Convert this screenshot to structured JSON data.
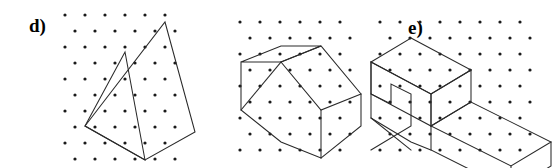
{
  "figure": {
    "background_color": "#ffffff",
    "ink_color": "#2a2a2a",
    "dot_color": "#1a1a1a",
    "width": 560,
    "height": 168
  },
  "panels": [
    {
      "id": "d",
      "label": "d)",
      "shape_name": "tilted-quadrilateral-with-triangle",
      "dot_grid": {
        "type": "staggered",
        "x_spacing": 20,
        "y_spacing": 16,
        "row_offset": 10,
        "dot_radius": 1.6,
        "origin_x": 65,
        "origin_y": 15,
        "cols": 6,
        "rows": 10
      },
      "polylines": [
        {
          "name": "outer-quadrilateral",
          "closed": true,
          "points": [
            [
              165,
              22
            ],
            [
              195,
              132
            ],
            [
              145,
              160
            ],
            [
              85,
              126
            ]
          ]
        },
        {
          "name": "triangle-left",
          "closed": true,
          "points": [
            [
              85,
              126
            ],
            [
              125,
              52
            ],
            [
              145,
              160
            ]
          ]
        }
      ]
    },
    {
      "id": "e",
      "label": "e)",
      "shape_name": "isometric-house-barn",
      "dot_grid": {
        "type": "staggered",
        "x_spacing": 20,
        "y_spacing": 16,
        "row_offset": 10,
        "dot_radius": 1.6,
        "origin_x": 240,
        "origin_y": 22,
        "cols": 6,
        "rows": 9
      },
      "polylines": [
        {
          "name": "roof-ridge-left-face",
          "closed": true,
          "points": [
            [
              241,
              62
            ],
            [
              281,
              46
            ],
            [
              321,
              46
            ],
            [
              281,
              62
            ]
          ]
        },
        {
          "name": "roof-right-slope",
          "closed": true,
          "points": [
            [
              281,
              62
            ],
            [
              321,
              46
            ],
            [
              361,
              94
            ],
            [
              321,
              110
            ]
          ]
        },
        {
          "name": "left-wall",
          "closed": false,
          "points": [
            [
              241,
              62
            ],
            [
              241,
              110
            ],
            [
              281,
              142
            ],
            [
              321,
              158
            ],
            [
              321,
              110
            ]
          ]
        },
        {
          "name": "front-gable-fold",
          "closed": false,
          "points": [
            [
              241,
              110
            ],
            [
              281,
              62
            ]
          ]
        },
        {
          "name": "right-wall-vertical",
          "closed": false,
          "points": [
            [
              361,
              94
            ],
            [
              361,
              126
            ],
            [
              321,
              158
            ]
          ]
        }
      ]
    },
    {
      "id": "f",
      "label": "f)",
      "shape_name": "isometric-L-step-block",
      "dot_grid": {
        "type": "staggered",
        "x_spacing": 20,
        "y_spacing": 16,
        "row_offset": 10,
        "dot_radius": 1.6,
        "origin_x": 380,
        "origin_y": 22,
        "cols": 8,
        "rows": 9
      },
      "polylines": [
        {
          "name": "upper-block-top-face",
          "closed": true,
          "points": [
            [
              411,
              38
            ],
            [
              471,
              70
            ],
            [
              431,
              94
            ],
            [
              371,
              62
            ]
          ]
        },
        {
          "name": "upper-block-front-face",
          "closed": true,
          "points": [
            [
              371,
              62
            ],
            [
              431,
              94
            ],
            [
              431,
              126
            ],
            [
              371,
              94
            ]
          ]
        },
        {
          "name": "upper-block-right-face",
          "closed": true,
          "points": [
            [
              431,
              94
            ],
            [
              471,
              70
            ],
            [
              471,
              102
            ],
            [
              431,
              126
            ]
          ]
        },
        {
          "name": "lower-step-top-face",
          "closed": true,
          "points": [
            [
              431,
              126
            ],
            [
              471,
              102
            ],
            [
              551,
              142
            ],
            [
              511,
              166
            ]
          ]
        },
        {
          "name": "lower-step-front-face",
          "closed": false,
          "points": [
            [
              431,
              126
            ],
            [
              431,
              150
            ],
            [
              511,
              190
            ],
            [
              511,
              166
            ]
          ]
        },
        {
          "name": "lower-step-right-edge",
          "closed": false,
          "points": [
            [
              551,
              142
            ],
            [
              551,
              166
            ],
            [
              511,
              190
            ]
          ]
        },
        {
          "name": "notch-left-wing",
          "closed": false,
          "points": [
            [
              371,
              62
            ],
            [
              371,
              94
            ],
            [
              391,
              104
            ],
            [
              391,
              84
            ],
            [
              411,
              94
            ],
            [
              411,
              126
            ],
            [
              371,
              150
            ]
          ]
        },
        {
          "name": "notch-base",
          "closed": false,
          "points": [
            [
              371,
              94
            ],
            [
              371,
              118
            ],
            [
              411,
              150
            ]
          ]
        },
        {
          "name": "notch-base-front",
          "closed": false,
          "points": [
            [
              371,
              118
            ],
            [
              411,
              142
            ],
            [
              431,
              150
            ]
          ]
        }
      ]
    }
  ]
}
